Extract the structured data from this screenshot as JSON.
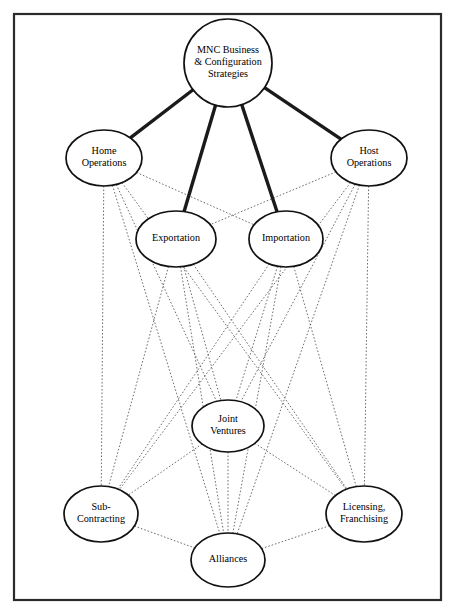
{
  "figure": {
    "border_color": "#2b2b2b",
    "background_color": "#ffffff",
    "primary_edge_color": "#1a1a1a",
    "dotted_edge_color": "#555555",
    "node_fill": "#ffffff",
    "node_stroke": "#111111"
  },
  "nodes": [
    {
      "id": "mnc",
      "lines": [
        "MNC Business",
        "& Configuration",
        "Strategies"
      ],
      "shape": "circle",
      "cx": 228,
      "cy": 63,
      "rx": 44,
      "ry": 44,
      "font_size": 10.2,
      "line_height": 11.6
    },
    {
      "id": "home",
      "lines": [
        "Home",
        "Operations"
      ],
      "shape": "ellipse",
      "cx": 104,
      "cy": 158,
      "rx": 38,
      "ry": 28,
      "font_size": 10.2,
      "line_height": 11.8
    },
    {
      "id": "host",
      "lines": [
        "Host",
        "Operations"
      ],
      "shape": "ellipse",
      "cx": 369,
      "cy": 158,
      "rx": 38,
      "ry": 28,
      "font_size": 10.2,
      "line_height": 11.8
    },
    {
      "id": "exportation",
      "lines": [
        "Exportation"
      ],
      "shape": "ellipse",
      "cx": 176,
      "cy": 239,
      "rx": 40,
      "ry": 28,
      "font_size": 10.2,
      "line_height": 11.8
    },
    {
      "id": "importation",
      "lines": [
        "Importation"
      ],
      "shape": "ellipse",
      "cx": 286,
      "cy": 239,
      "rx": 37,
      "ry": 28,
      "font_size": 10.2,
      "line_height": 11.8
    },
    {
      "id": "joint",
      "lines": [
        "Joint",
        "Ventures"
      ],
      "shape": "ellipse",
      "cx": 228,
      "cy": 426,
      "rx": 36,
      "ry": 26,
      "font_size": 10.2,
      "line_height": 11.8
    },
    {
      "id": "sub",
      "lines": [
        "Sub-",
        "Contracting"
      ],
      "shape": "ellipse",
      "cx": 101,
      "cy": 514,
      "rx": 37,
      "ry": 28,
      "font_size": 10.2,
      "line_height": 11.8
    },
    {
      "id": "licensing",
      "lines": [
        "Licensing,",
        "Franchising"
      ],
      "shape": "ellipse",
      "cx": 364,
      "cy": 514,
      "rx": 38,
      "ry": 28,
      "font_size": 10.2,
      "line_height": 11.8
    },
    {
      "id": "alliances",
      "lines": [
        "Alliances"
      ],
      "shape": "ellipse",
      "cx": 228,
      "cy": 560,
      "rx": 37,
      "ry": 27,
      "font_size": 10.2,
      "line_height": 11.8
    }
  ],
  "edges_primary": [
    {
      "from": "mnc",
      "to": "home"
    },
    {
      "from": "mnc",
      "to": "exportation"
    },
    {
      "from": "mnc",
      "to": "importation"
    },
    {
      "from": "mnc",
      "to": "host"
    }
  ],
  "edges_dotted": [
    {
      "from": "home",
      "to": "importation"
    },
    {
      "from": "host",
      "to": "exportation"
    },
    {
      "from": "home",
      "to": "joint"
    },
    {
      "from": "home",
      "to": "sub"
    },
    {
      "from": "home",
      "to": "alliances"
    },
    {
      "from": "home",
      "to": "licensing"
    },
    {
      "from": "host",
      "to": "joint"
    },
    {
      "from": "host",
      "to": "sub"
    },
    {
      "from": "host",
      "to": "alliances"
    },
    {
      "from": "host",
      "to": "licensing"
    },
    {
      "from": "exportation",
      "to": "joint"
    },
    {
      "from": "exportation",
      "to": "sub"
    },
    {
      "from": "exportation",
      "to": "alliances"
    },
    {
      "from": "exportation",
      "to": "licensing"
    },
    {
      "from": "importation",
      "to": "joint"
    },
    {
      "from": "importation",
      "to": "sub"
    },
    {
      "from": "importation",
      "to": "alliances"
    },
    {
      "from": "importation",
      "to": "licensing"
    },
    {
      "from": "joint",
      "to": "sub"
    },
    {
      "from": "joint",
      "to": "licensing"
    },
    {
      "from": "joint",
      "to": "alliances"
    },
    {
      "from": "sub",
      "to": "alliances"
    },
    {
      "from": "licensing",
      "to": "alliances"
    }
  ],
  "frame": {
    "x": 14,
    "y": 14,
    "width": 427,
    "height": 586
  }
}
